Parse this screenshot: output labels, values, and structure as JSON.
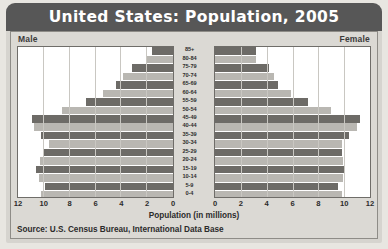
{
  "banner": {
    "title": "United States: Population, 2005"
  },
  "panel": {
    "male_label": "Male",
    "female_label": "Female"
  },
  "source": {
    "text": "Source: U.S. Census Bureau, International Data Base"
  },
  "chart_data": {
    "type": "bar",
    "subtype": "population-pyramid",
    "title": "United States: Population, 2005",
    "xlabel": "Population (in millions)",
    "ylabel": "",
    "orientation": "horizontal",
    "grid": false,
    "legend_position": "top-corners",
    "axis_ticks": [
      "12",
      "10",
      "8",
      "6",
      "4",
      "2",
      "0",
      "0",
      "2",
      "4",
      "6",
      "8",
      "10",
      "12"
    ],
    "left_ticks": [
      12,
      10,
      8,
      6,
      4,
      2,
      0
    ],
    "right_ticks": [
      0,
      2,
      4,
      6,
      8,
      10,
      12
    ],
    "xlim": [
      0,
      12
    ],
    "categories": [
      "85+",
      "80-84",
      "75-79",
      "70-74",
      "65-69",
      "60-64",
      "55-59",
      "50-54",
      "45-49",
      "40-44",
      "35-39",
      "30-34",
      "25-29",
      "20-24",
      "15-19",
      "10-14",
      "5-9",
      "0-4"
    ],
    "series": [
      {
        "name": "Male",
        "side": "left",
        "values": [
          1.6,
          2.0,
          3.2,
          3.9,
          4.4,
          5.4,
          6.7,
          8.6,
          10.9,
          10.8,
          10.2,
          9.6,
          10.0,
          10.3,
          10.6,
          10.4,
          9.9,
          10.2
        ]
      },
      {
        "name": "Female",
        "side": "right",
        "values": [
          3.2,
          3.2,
          4.2,
          4.6,
          4.9,
          5.9,
          7.2,
          9.0,
          11.2,
          11.0,
          10.4,
          9.8,
          9.8,
          9.9,
          10.1,
          9.9,
          9.5,
          9.8
        ]
      }
    ]
  }
}
